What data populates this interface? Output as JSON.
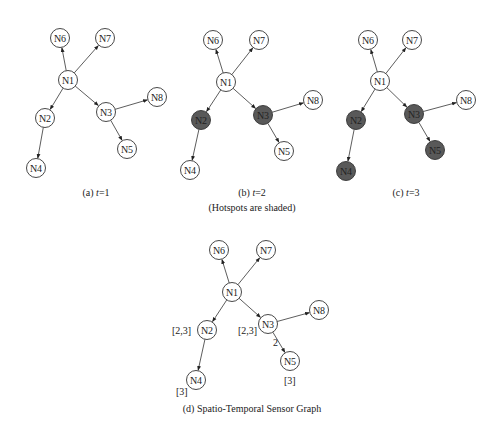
{
  "colors": {
    "node_fill": "#ffffff",
    "hotspot_fill": "#595959",
    "stroke": "#333333",
    "text": "#222222"
  },
  "edges": [
    [
      "N1",
      "N6"
    ],
    [
      "N1",
      "N7"
    ],
    [
      "N1",
      "N2"
    ],
    [
      "N1",
      "N3"
    ],
    [
      "N3",
      "N8"
    ],
    [
      "N3",
      "N5"
    ],
    [
      "N2",
      "N4"
    ]
  ],
  "panels": [
    {
      "id": "a",
      "caption": "(a) t=1",
      "caption_pos": [
        96,
        196
      ],
      "hotspots": [],
      "nodes": {
        "N6": [
          60,
          38
        ],
        "N7": [
          105,
          38
        ],
        "N1": [
          68,
          80
        ],
        "N2": [
          45,
          118
        ],
        "N3": [
          106,
          112
        ],
        "N8": [
          157,
          97
        ],
        "N5": [
          127,
          149
        ],
        "N4": [
          36,
          168
        ]
      }
    },
    {
      "id": "b",
      "caption": "(b) t=2",
      "caption_pos": [
        252,
        196
      ],
      "hotspots": [
        "N2",
        "N3"
      ],
      "nodes": {
        "N6": [
          213,
          40
        ],
        "N7": [
          259,
          40
        ],
        "N1": [
          226,
          82
        ],
        "N2": [
          201,
          120
        ],
        "N3": [
          263,
          115
        ],
        "N8": [
          313,
          100
        ],
        "N5": [
          284,
          151
        ],
        "N4": [
          190,
          170
        ]
      }
    },
    {
      "id": "c",
      "caption": "(c) t=3",
      "caption_pos": [
        406,
        196
      ],
      "hotspots": [
        "N2",
        "N3",
        "N5",
        "N4"
      ],
      "nodes": {
        "N6": [
          368,
          40
        ],
        "N7": [
          412,
          40
        ],
        "N1": [
          380,
          81
        ],
        "N2": [
          356,
          120
        ],
        "N3": [
          414,
          114
        ],
        "N8": [
          466,
          100
        ],
        "N5": [
          435,
          150
        ],
        "N4": [
          346,
          171
        ]
      }
    },
    {
      "id": "d",
      "caption": "(d) Spatio-Temporal Sensor Graph",
      "caption_pos": [
        252,
        412
      ],
      "hotspots": [],
      "nodes": {
        "N6": [
          219,
          250
        ],
        "N7": [
          266,
          250
        ],
        "N1": [
          232,
          292
        ],
        "N2": [
          207,
          330
        ],
        "N3": [
          268,
          324
        ],
        "N8": [
          319,
          310
        ],
        "N5": [
          290,
          361
        ],
        "N4": [
          196,
          380
        ]
      },
      "annotations": [
        {
          "text": "[2,3]",
          "x": 172,
          "y": 334
        },
        {
          "text": "[2,3]",
          "x": 238,
          "y": 334
        },
        {
          "text": "2",
          "x": 273,
          "y": 346
        },
        {
          "text": "[3]",
          "x": 284,
          "y": 384
        },
        {
          "text": "[3]",
          "x": 176,
          "y": 395
        }
      ]
    }
  ],
  "subcaption": {
    "text": "(Hotspots are shaded)",
    "pos": [
      252,
      211
    ]
  }
}
